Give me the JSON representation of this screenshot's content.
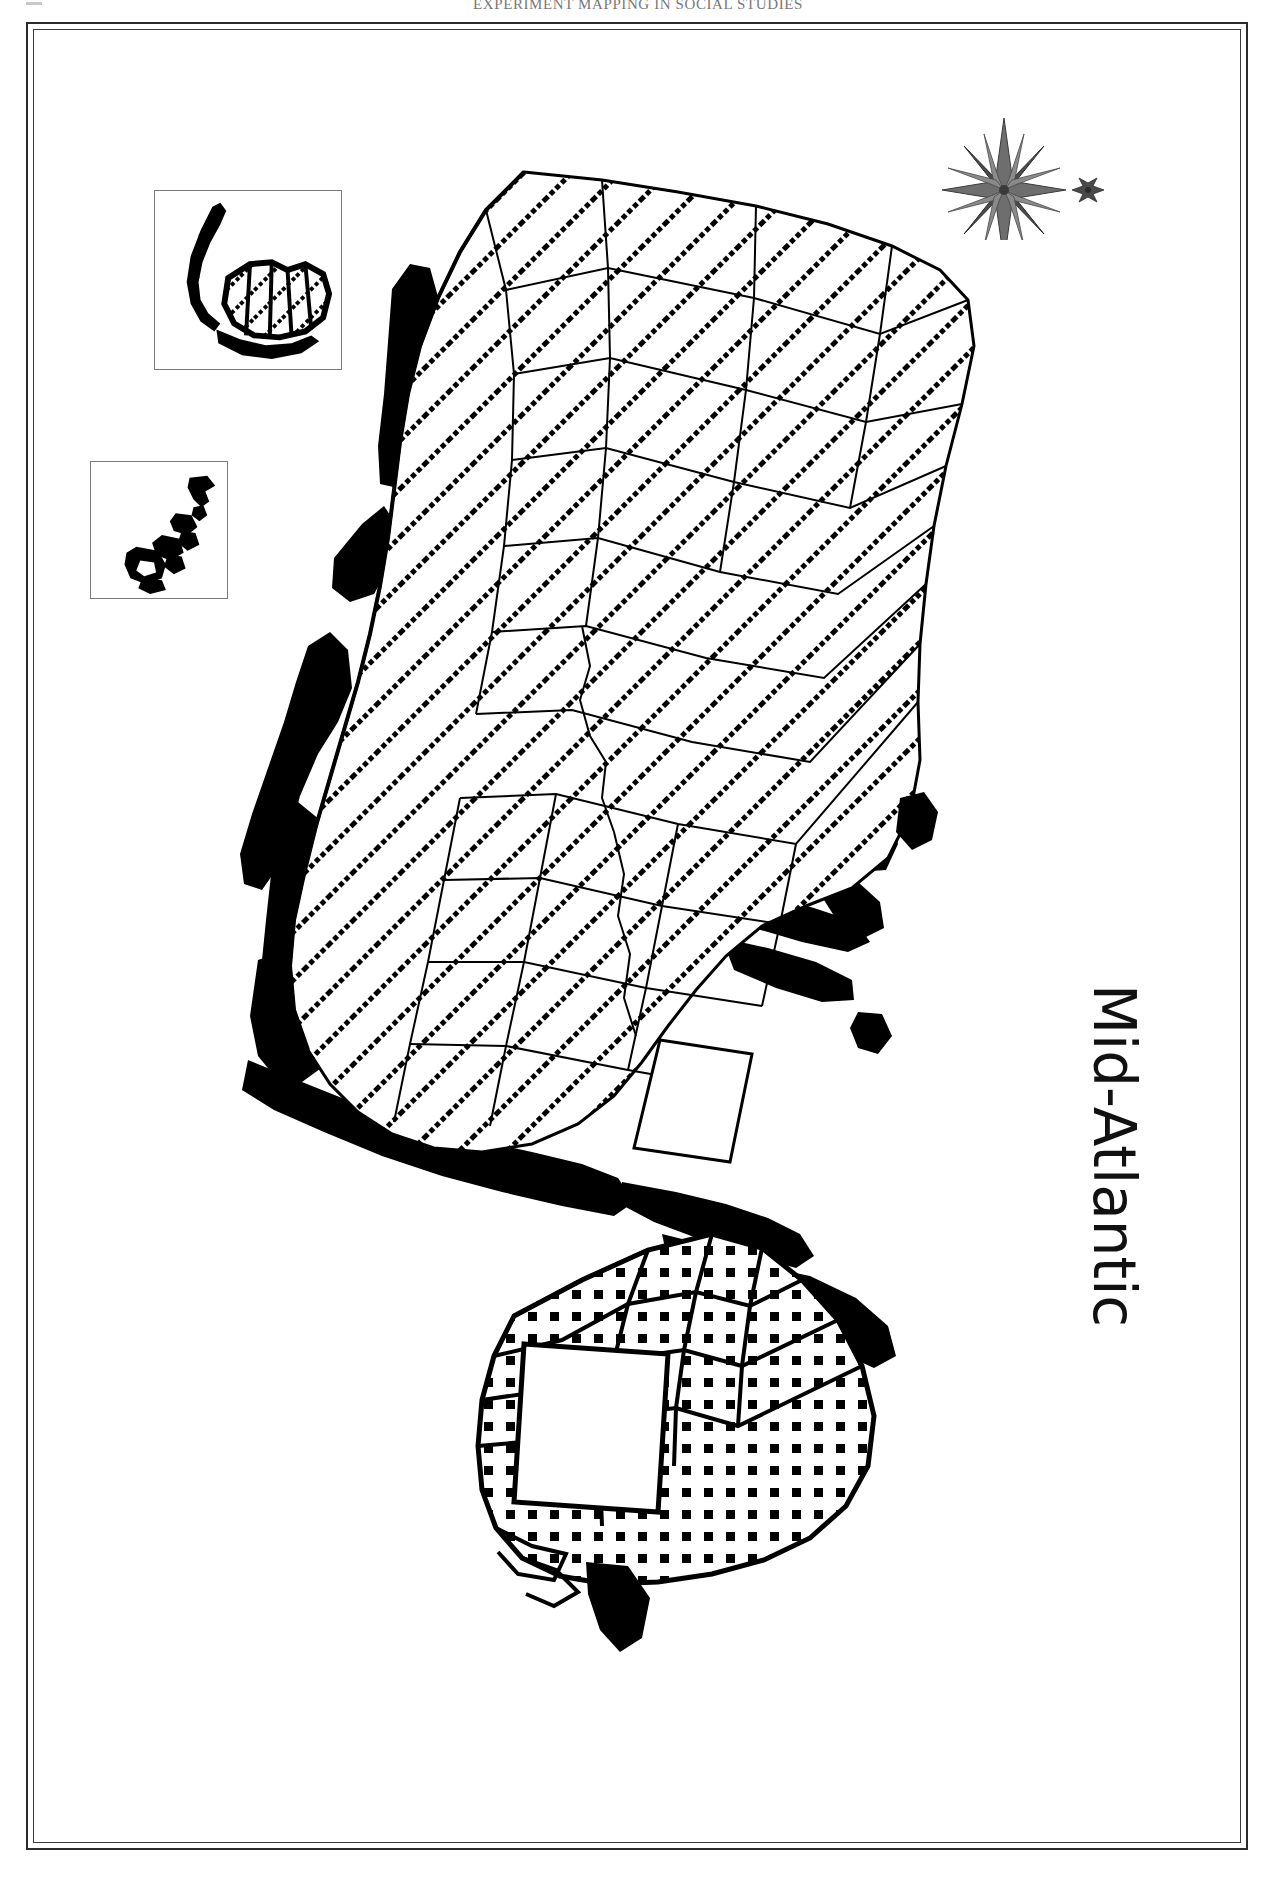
{
  "page": {
    "running_header": "EXPERIMENT MAPPING IN SOCIAL STUDIES",
    "folio_icon": "page-corner-mark"
  },
  "map": {
    "title": "Mid-Atlantic",
    "orientation_note": "map rotated 90 degrees on page",
    "compass": {
      "icon": "compass-rose-icon",
      "north_pointer": "fleur-de-lis-north-icon",
      "points": 16
    },
    "insets": [
      {
        "id": "inset-pr",
        "name": "puerto-rico-inset",
        "fill_pattern": "diagonal-dot-hatch"
      },
      {
        "id": "inset-vi",
        "name": "virgin-islands-inset",
        "fill_pattern": "solid-black"
      }
    ],
    "regions": [
      {
        "name": "mainland-mid-atlantic",
        "fill_pattern": "diagonal-dot-hatch",
        "description": "county-subdivided mainland states"
      },
      {
        "name": "southern-landmass",
        "fill_pattern": "square-dot-stipple",
        "description": "stippled adjacent region"
      },
      {
        "name": "coastal-water-bodies",
        "fill_pattern": "solid-black",
        "description": "bays, sounds and coastal water filled black"
      },
      {
        "name": "unshaded-enclave",
        "fill_pattern": "white",
        "description": "white unshaded interior polygon"
      }
    ],
    "colors": {
      "ink": "#000000",
      "frame": "#2b2b2b",
      "header_text": "#5a5a5a",
      "paper": "#ffffff",
      "inset_border": "#7a7a7a"
    }
  }
}
